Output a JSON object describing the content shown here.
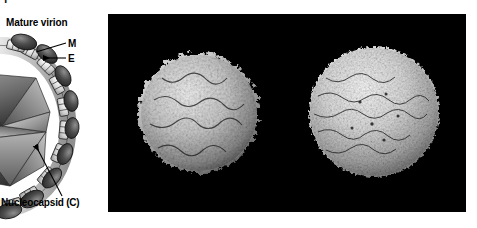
{
  "figure": {
    "width": 477,
    "height": 228,
    "background_color": "#ffffff"
  },
  "schematic": {
    "clipped_glyph": "Y",
    "title": "Mature virion",
    "labels": {
      "m_protein": "M",
      "e_protein": "E",
      "nucleocapsid": "Nucleocapsid (C)"
    },
    "colors": {
      "outline": "#000000",
      "core_dark": "#3b3b3b",
      "core_mid": "#7d7d7d",
      "core_light": "#d2d2d2",
      "membrane_fill": "#c9c9c9",
      "protein_dark": "#4a4a4a",
      "label_text": "#000000"
    }
  },
  "em_panel": {
    "background_color": "#000000",
    "particles": [
      {
        "name": "spiky-reconstruction",
        "description": "rough spiky surface reconstruction",
        "surface": "spiky"
      },
      {
        "name": "smooth-reconstruction",
        "description": "smooth granular surface reconstruction",
        "surface": "smooth"
      }
    ]
  }
}
